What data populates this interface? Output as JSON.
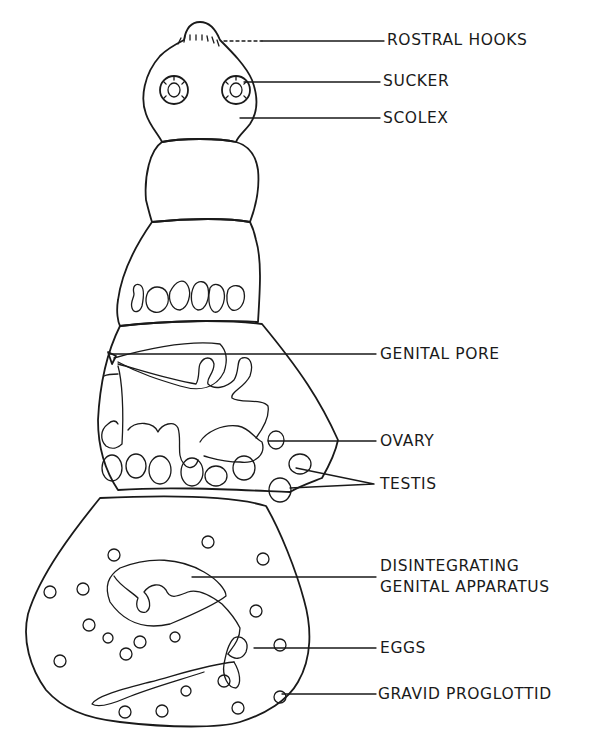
{
  "figure": {
    "labels": {
      "rostral_hooks": "ROSTRAL HOOKS",
      "sucker": "SUCKER",
      "scolex": "SCOLEX",
      "genital_pore": "GENITAL PORE",
      "ovary": "OVARY",
      "testis": "TESTIS",
      "disintegrating_line1": "DISINTEGRATING",
      "disintegrating_line2": "GENITAL APPARATUS",
      "eggs": "EGGS",
      "gravid_proglottid": "GRAVID PROGLOTTID"
    }
  },
  "colors": {
    "ink": "#1a1a1a",
    "background": "#ffffff"
  }
}
